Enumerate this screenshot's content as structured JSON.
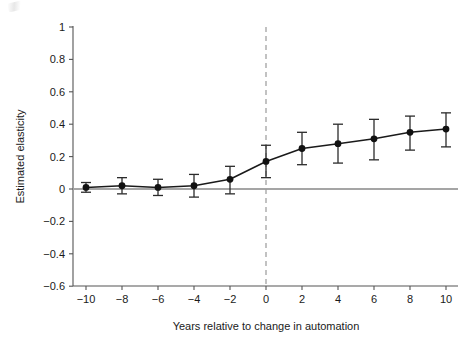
{
  "chart_data": {
    "type": "line",
    "title": "",
    "subtitle": "",
    "xlabel": "Years relative to change in automation",
    "ylabel": "Estimated elasticity",
    "x": [
      -10,
      -8,
      -6,
      -4,
      -2,
      0,
      2,
      4,
      6,
      8,
      10
    ],
    "values": [
      0.01,
      0.02,
      0.01,
      0.02,
      0.06,
      0.17,
      0.25,
      0.28,
      0.31,
      0.35,
      0.37
    ],
    "err_low": [
      -0.02,
      -0.03,
      -0.04,
      -0.05,
      -0.03,
      0.07,
      0.15,
      0.16,
      0.18,
      0.24,
      0.26
    ],
    "err_high": [
      0.04,
      0.07,
      0.06,
      0.09,
      0.14,
      0.27,
      0.35,
      0.4,
      0.43,
      0.45,
      0.47
    ],
    "xlim": [
      -11,
      11
    ],
    "ylim": [
      -0.65,
      1.05
    ],
    "xticks": [
      -10,
      -8,
      -6,
      -4,
      -2,
      0,
      2,
      4,
      6,
      8,
      10
    ],
    "xtick_labels": [
      "−10",
      "−8",
      "−6",
      "−4",
      "−2",
      "0",
      "2",
      "4",
      "6",
      "8",
      "10"
    ],
    "yticks": [
      -0.6,
      -0.4,
      -0.2,
      0,
      0.2,
      0.4,
      0.6,
      0.8,
      1
    ],
    "ytick_labels": [
      "−0.6",
      "−0.4",
      "−0.2",
      "0",
      "0.2",
      "0.4",
      "0.6",
      "0.8",
      "1"
    ],
    "grid": false,
    "legend": "none",
    "annotations": [
      {
        "name": "zero-reference-line",
        "type": "hline",
        "y": 0,
        "style": "solid"
      },
      {
        "name": "event-time-line",
        "type": "vline",
        "x": 0,
        "style": "dashed"
      }
    ],
    "series_name": "Estimated elasticity",
    "marker": "filled-circle",
    "line_color": "#1a1a1a",
    "marker_color": "#111111",
    "errorbar_color": "#2b2b2b",
    "dashed_line_color": "#9a9a9a",
    "zero_line_color": "#4d4d4d",
    "axis_color": "#555555"
  }
}
